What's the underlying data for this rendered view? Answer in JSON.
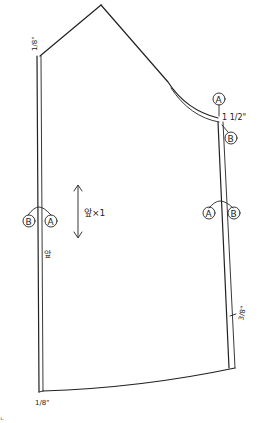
{
  "diagram": {
    "type": "sewing-pattern",
    "ink_color": "#222222",
    "background": "#ffffff",
    "piece": {
      "grainline_label": "앞×1",
      "top_left_allowance": "1/8\"",
      "bottom_left_allowance": "1/8\"",
      "right_shoulder_allowance": "1 1/2\"",
      "right_lower_allowance": "3/8\"",
      "left_notch_mark": "앞"
    },
    "notches": {
      "top_right_upper": "A",
      "top_right_lower": "B",
      "left_mid_left": "B",
      "left_mid_right": "A",
      "right_mid_left": "A",
      "right_mid_right": "B"
    },
    "corner_mark": "ㄴ"
  }
}
